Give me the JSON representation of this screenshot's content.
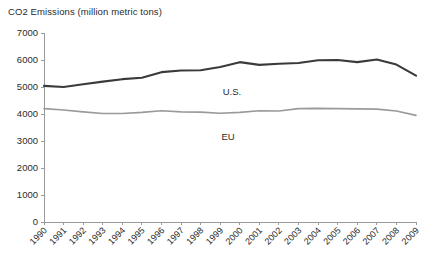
{
  "chart_data": {
    "type": "line",
    "title": "CO2 Emissions (million metric tons)",
    "xlabel": "",
    "ylabel": "",
    "ylim": [
      0,
      7000
    ],
    "ytick_step": 1000,
    "yticks": [
      0,
      1000,
      2000,
      3000,
      4000,
      5000,
      6000,
      7000
    ],
    "ytick_labels": [
      "0",
      "1000",
      "2000",
      "3000",
      "4000",
      "5000",
      "6000",
      "7000"
    ],
    "grid": false,
    "legend_position": "inline-annotation",
    "categories": [
      "1990",
      "1991",
      "1992",
      "1993",
      "1994",
      "1995",
      "1996",
      "1997",
      "1998",
      "1999",
      "2000",
      "2001",
      "2002",
      "2003",
      "2004",
      "2005",
      "2006",
      "2007",
      "2008",
      "2009"
    ],
    "series": [
      {
        "name": "U.S.",
        "color": "#3a3a3a",
        "line_width": 2.1,
        "annotation": "U.S.",
        "values": [
          5040,
          5000,
          5100,
          5200,
          5290,
          5340,
          5550,
          5610,
          5620,
          5740,
          5920,
          5820,
          5860,
          5890,
          5990,
          6000,
          5920,
          6020,
          5830,
          5420
        ]
      },
      {
        "name": "EU",
        "color": "#9a9a9a",
        "line_width": 1.6,
        "annotation": "EU",
        "values": [
          4200,
          4150,
          4080,
          4020,
          4020,
          4060,
          4120,
          4080,
          4070,
          4030,
          4060,
          4120,
          4110,
          4200,
          4210,
          4200,
          4190,
          4180,
          4110,
          3950
        ]
      }
    ]
  }
}
